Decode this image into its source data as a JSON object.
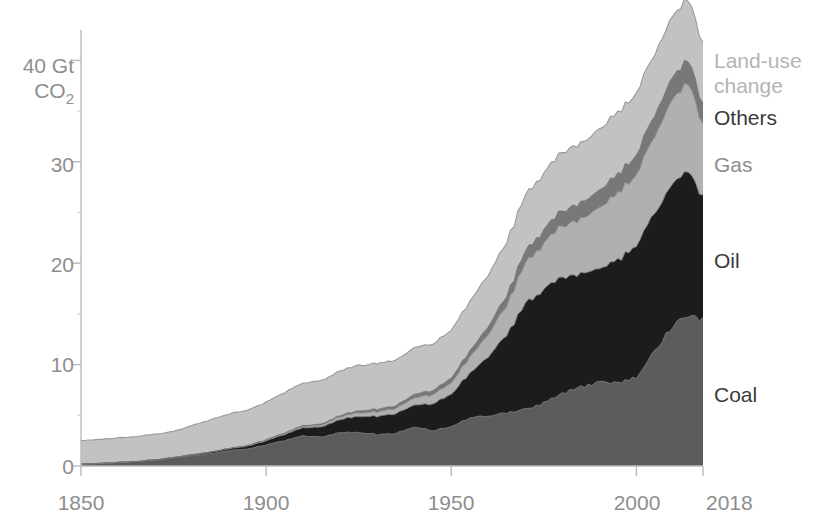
{
  "chart_data": {
    "type": "area",
    "stacked": true,
    "title": "",
    "subtitle": "",
    "xlabel": "",
    "ylabel": "Gt CO2",
    "y_unit_label_line1": "40 Gt",
    "y_unit_label_line2": "CO2",
    "y_unit_sub": "2",
    "xlim": [
      1850,
      2018
    ],
    "ylim": [
      0,
      43
    ],
    "grid": false,
    "legend_position": "right-inline",
    "x_tick_labels": [
      "1850",
      "1900",
      "1950",
      "2000",
      "2018"
    ],
    "x_ticks": [
      1850,
      1900,
      1950,
      2000,
      2018
    ],
    "y_tick_labels": [
      "0",
      "10",
      "20",
      "30",
      "40"
    ],
    "y_ticks": [
      0,
      10,
      20,
      30,
      40
    ],
    "y_minor_ticks": [
      5,
      15,
      25,
      35
    ],
    "colors": {
      "coal": "#5c5c5c",
      "oil": "#1c1c1c",
      "gas": "#b0b0b0",
      "others": "#787878",
      "land_use_change": "#c2c2c2",
      "outline": "#8e8e8e",
      "axis": "#b9b9b9",
      "text_light": "#b4b4b4",
      "text_mid": "#8e8e8e",
      "text_dark": "#3a3a3a"
    },
    "x": [
      1850,
      1855,
      1860,
      1865,
      1870,
      1875,
      1880,
      1885,
      1890,
      1895,
      1900,
      1905,
      1910,
      1915,
      1920,
      1925,
      1930,
      1935,
      1940,
      1945,
      1950,
      1955,
      1960,
      1965,
      1970,
      1975,
      1980,
      1985,
      1990,
      1995,
      2000,
      2005,
      2010,
      2014,
      2018
    ],
    "series": [
      {
        "name": "Coal",
        "key": "coal",
        "color": "#5c5c5c",
        "label_y_value": 7.5,
        "values": [
          0.2,
          0.25,
          0.35,
          0.45,
          0.6,
          0.8,
          1.0,
          1.2,
          1.5,
          1.7,
          2.1,
          2.5,
          3.0,
          2.9,
          3.3,
          3.3,
          3.1,
          3.2,
          3.9,
          3.5,
          3.9,
          4.7,
          5.0,
          5.2,
          5.6,
          6.2,
          7.1,
          7.8,
          8.2,
          8.2,
          8.8,
          11.5,
          13.8,
          14.7,
          14.5
        ]
      },
      {
        "name": "Oil",
        "key": "oil",
        "color": "#1c1c1c",
        "label_y_value": 21.0,
        "values": [
          0.0,
          0.0,
          0.0,
          0.0,
          0.0,
          0.05,
          0.1,
          0.15,
          0.2,
          0.3,
          0.4,
          0.6,
          0.8,
          1.0,
          1.3,
          1.6,
          1.8,
          1.9,
          2.2,
          2.6,
          3.2,
          4.4,
          5.9,
          7.6,
          10.5,
          11.1,
          11.6,
          11.0,
          11.3,
          12.2,
          12.9,
          13.6,
          14.0,
          14.3,
          12.0
        ]
      },
      {
        "name": "Gas",
        "key": "gas",
        "color": "#b0b0b0",
        "label_y_value": 31.0,
        "values": [
          0.0,
          0.0,
          0.0,
          0.0,
          0.0,
          0.0,
          0.0,
          0.0,
          0.0,
          0.02,
          0.05,
          0.08,
          0.12,
          0.16,
          0.25,
          0.35,
          0.45,
          0.5,
          0.7,
          0.9,
          1.1,
          1.6,
          2.2,
          2.9,
          4.0,
          4.5,
          5.1,
          5.4,
          6.0,
          6.5,
          7.0,
          7.6,
          8.3,
          8.8,
          7.0
        ]
      },
      {
        "name": "Others",
        "key": "others",
        "color": "#787878",
        "label_y_value": 36.5,
        "values": [
          0.0,
          0.0,
          0.0,
          0.0,
          0.0,
          0.0,
          0.0,
          0.0,
          0.02,
          0.03,
          0.05,
          0.07,
          0.1,
          0.12,
          0.16,
          0.2,
          0.25,
          0.28,
          0.35,
          0.4,
          0.5,
          0.6,
          0.8,
          0.95,
          1.2,
          1.35,
          1.5,
          1.6,
          1.75,
          1.85,
          1.95,
          2.1,
          2.2,
          2.3,
          2.0
        ]
      },
      {
        "name": "Land-use change",
        "key": "land_use_change",
        "color": "#c2c2c2",
        "label_y_value": 40.5,
        "values": [
          2.3,
          2.35,
          2.4,
          2.45,
          2.5,
          2.55,
          2.9,
          3.2,
          3.4,
          3.5,
          3.7,
          4.0,
          4.2,
          4.3,
          4.4,
          4.5,
          4.5,
          4.5,
          4.6,
          4.6,
          4.7,
          4.9,
          5.1,
          5.3,
          5.5,
          5.6,
          5.8,
          5.9,
          6.0,
          6.1,
          6.1,
          6.0,
          6.0,
          6.0,
          6.0
        ]
      }
    ],
    "totals_note": "Stacked totals rise from about 2.5 Gt CO2 in 1850 to about 41.5 Gt CO2 in 2018."
  },
  "legend": {
    "items": [
      {
        "label": "Land-use",
        "label_full": "Land-use change",
        "tone": "light"
      },
      {
        "label": "change",
        "tone": "light"
      },
      {
        "label": "Others",
        "tone": "dark"
      },
      {
        "label": "Gas",
        "tone": "mid"
      },
      {
        "label": "Oil",
        "tone": "dark"
      },
      {
        "label": "Coal",
        "tone": "dark"
      }
    ],
    "land_use_line1": "Land-use",
    "land_use_line2": "change",
    "others": "Others",
    "gas": "Gas",
    "oil": "Oil",
    "coal": "Coal"
  },
  "axes": {
    "y_label_40": "40 Gt",
    "y_label_co2": "CO",
    "y_label_co2_sub": "2",
    "y_label_30": "30",
    "y_label_20": "20",
    "y_label_10": "10",
    "y_label_0": "0",
    "x_label_1850": "1850",
    "x_label_1900": "1900",
    "x_label_1950": "1950",
    "x_label_2000": "2000",
    "x_label_2018": "2018"
  }
}
